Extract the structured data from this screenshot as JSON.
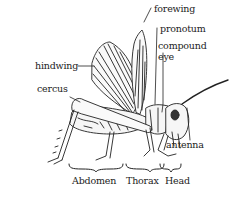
{
  "diagram": {
    "labels": {
      "forewing": "forewing",
      "pronotum": "pronotum",
      "compound_eye_line1": "compound",
      "compound_eye_line2": "eye",
      "hindwing": "hindwing",
      "cercus": "cercus",
      "antenna": "antenna"
    },
    "regions": {
      "abdomen": "Abdomen",
      "thorax": "Thorax",
      "head": "Head"
    },
    "colors": {
      "ink": "#222222",
      "background": "#ffffff"
    }
  }
}
